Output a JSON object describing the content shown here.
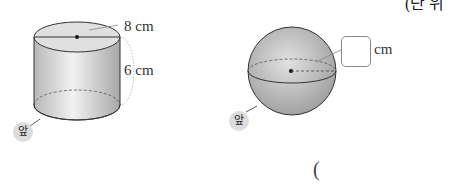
{
  "header_clip": {
    "text": "(단 위"
  },
  "cylinder": {
    "diameter_label": "8 cm",
    "height_label": "6 cm",
    "front_label": "앞"
  },
  "sphere": {
    "radius_unit": "cm",
    "radius_value": "",
    "front_label": "앞"
  },
  "answer": {
    "open_paren": "("
  }
}
